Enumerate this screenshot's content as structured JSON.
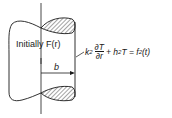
{
  "diagram": {
    "initial_condition": "Initially F(r)",
    "radius_label": "b",
    "boundary_condition": {
      "coef1": "k",
      "sub1": "2",
      "derivative_num": "∂T",
      "derivative_den": "∂r",
      "plus": "+ h",
      "sub2": "2",
      "rhs": "T = f",
      "sub3": "2",
      "arg": "(t)"
    },
    "colors": {
      "stroke": "#1a1a1a",
      "background": "#ffffff"
    }
  }
}
